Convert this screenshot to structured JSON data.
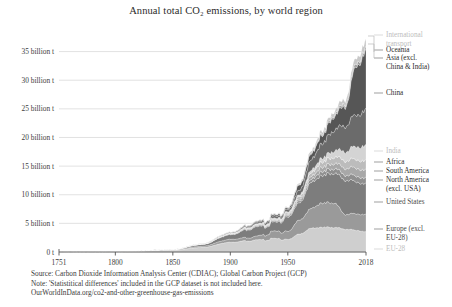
{
  "header": {
    "title": "Annual total CO₂ emissions, by world region"
  },
  "footer": {
    "source": "Source: Carbon Dioxide Information Analysis Center (CDIAC); Global Carbon Project (GCP)",
    "note": "Note: 'Statistitical differences' included in the GCP dataset is not included here.",
    "url": "OurWorldInData.org/co2-and-other-greenhouse-gas-emissions"
  },
  "chart_data": {
    "type": "area",
    "title": "Annual total CO₂ emissions, by world region",
    "xlabel": "",
    "ylabel": "",
    "xlim": [
      1751,
      2018
    ],
    "ylim": [
      0,
      36500000000
    ],
    "grid": true,
    "legend_position": "right",
    "stacked": true,
    "yticks": [
      0,
      5,
      10,
      15,
      20,
      25,
      30,
      35
    ],
    "ytick_labels": [
      "0 t",
      "5 billion t",
      "10 billion t",
      "15 billion t",
      "20 billion t",
      "25 billion t",
      "30 billion t",
      "35 billion t"
    ],
    "xticks": [
      1751,
      1800,
      1850,
      1900,
      1950,
      2018
    ],
    "xtick_labels": [
      "1751",
      "1800",
      "1850",
      "1900",
      "1950",
      "2018"
    ],
    "x": [
      1751,
      1800,
      1850,
      1875,
      1900,
      1920,
      1940,
      1950,
      1960,
      1970,
      1980,
      1990,
      2000,
      2010,
      2018
    ],
    "series": [
      {
        "name": "EU-28",
        "color": "#cfcfcf",
        "label_color": "#bdbdbd",
        "values": [
          0.01,
          0.04,
          0.3,
          0.8,
          1.7,
          2.1,
          2.4,
          2.2,
          3.1,
          4.1,
          4.4,
          4.3,
          4.0,
          3.8,
          3.5
        ]
      },
      {
        "name": "Europe (excl. EU-28)",
        "color": "#9a9a9a",
        "label_color": "#4a4a4a",
        "values": [
          0.0,
          0.01,
          0.05,
          0.2,
          0.5,
          0.6,
          1.3,
          1.4,
          2.4,
          3.4,
          4.3,
          4.3,
          2.6,
          2.9,
          3.0
        ]
      },
      {
        "name": "United States",
        "color": "#7d7d7d",
        "label_color": "#4a4a4a",
        "values": [
          0.0,
          0.01,
          0.07,
          0.3,
          0.8,
          1.6,
          1.6,
          2.5,
          3.0,
          4.5,
          4.9,
          5.2,
          6.0,
          5.6,
          5.3
        ]
      },
      {
        "name": "North America (excl. USA)",
        "color": "#8f8f8f",
        "label_color": "#3a3a3a",
        "values": [
          0.0,
          0.0,
          0.01,
          0.03,
          0.08,
          0.15,
          0.18,
          0.25,
          0.35,
          0.5,
          0.7,
          0.8,
          0.9,
          1.0,
          1.0
        ]
      },
      {
        "name": "South America",
        "color": "#a8a8a8",
        "label_color": "#3a3a3a",
        "values": [
          0.0,
          0.0,
          0.01,
          0.02,
          0.05,
          0.1,
          0.12,
          0.2,
          0.3,
          0.5,
          0.8,
          0.9,
          1.2,
          1.4,
          1.4
        ]
      },
      {
        "name": "Africa",
        "color": "#bcbcbc",
        "label_color": "#3a3a3a",
        "values": [
          0.0,
          0.0,
          0.01,
          0.02,
          0.05,
          0.1,
          0.15,
          0.25,
          0.4,
          0.6,
          0.9,
          1.1,
          1.3,
          1.5,
          1.6
        ]
      },
      {
        "name": "India",
        "color": "#d4d4d4",
        "label_color": "#bdbdbd",
        "values": [
          0.0,
          0.0,
          0.01,
          0.03,
          0.08,
          0.15,
          0.2,
          0.22,
          0.3,
          0.45,
          0.7,
          1.1,
          1.6,
          2.3,
          2.6
        ]
      },
      {
        "name": "Asia (excl. China & India)",
        "color": "#6b6b6b",
        "label_color": "#2b2b2b",
        "values": [
          0.0,
          0.0,
          0.01,
          0.03,
          0.1,
          0.25,
          0.4,
          0.4,
          0.8,
          1.8,
          2.6,
          3.6,
          4.5,
          5.6,
          6.2
        ]
      },
      {
        "name": "China",
        "color": "#565656",
        "label_color": "#2b2b2b",
        "values": [
          0.0,
          0.0,
          0.01,
          0.02,
          0.06,
          0.15,
          0.25,
          0.25,
          0.9,
          1.0,
          1.5,
          2.4,
          3.5,
          8.7,
          10.1
        ]
      },
      {
        "name": "Oceania",
        "color": "#9e9e9e",
        "label_color": "#2b2b2b",
        "values": [
          0.0,
          0.0,
          0.0,
          0.01,
          0.02,
          0.04,
          0.05,
          0.06,
          0.1,
          0.18,
          0.25,
          0.32,
          0.42,
          0.5,
          0.5
        ]
      },
      {
        "name": "International transport",
        "color": "#c8c8c8",
        "label_color": "#bdbdbd",
        "values": [
          0.0,
          0.0,
          0.0,
          0.01,
          0.02,
          0.05,
          0.08,
          0.12,
          0.2,
          0.35,
          0.5,
          0.6,
          0.8,
          1.0,
          1.2
        ]
      }
    ],
    "legend_entries": [
      {
        "label_line1": "International",
        "label_line2": "transport",
        "color": "#bdbdbd"
      },
      {
        "label_line1": "Oceania",
        "label_line2": "",
        "color": "#2b2b2b"
      },
      {
        "label_line1": "Asia (excl.",
        "label_line2": "China & India)",
        "color": "#2b2b2b"
      },
      {
        "label_line1": "China",
        "label_line2": "",
        "color": "#2b2b2b"
      },
      {
        "label_line1": "India",
        "label_line2": "",
        "color": "#bdbdbd"
      },
      {
        "label_line1": "Africa",
        "label_line2": "",
        "color": "#2b2b2b"
      },
      {
        "label_line1": "South America",
        "label_line2": "",
        "color": "#2b2b2b"
      },
      {
        "label_line1": "North America",
        "label_line2": "(excl. USA)",
        "color": "#2b2b2b"
      },
      {
        "label_line1": "United States",
        "label_line2": "",
        "color": "#4a4a4a"
      },
      {
        "label_line1": "Europe (excl.",
        "label_line2": "EU-28)",
        "color": "#4a4a4a"
      },
      {
        "label_line1": "EU-28",
        "label_line2": "",
        "color": "#bdbdbd"
      }
    ]
  }
}
